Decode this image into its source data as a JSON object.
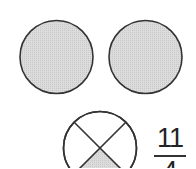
{
  "figure": {
    "whole_circles": [
      {
        "id": "circle-1",
        "shaded": true
      },
      {
        "id": "circle-2",
        "shaded": true
      }
    ],
    "partial_circle": {
      "parts": 4,
      "shaded_parts": 1
    },
    "fraction": {
      "numerator": "11",
      "denominator": "4"
    },
    "colors": {
      "stroke": "#333333",
      "shade": "#d6d6d6",
      "background": "#ffffff"
    }
  }
}
